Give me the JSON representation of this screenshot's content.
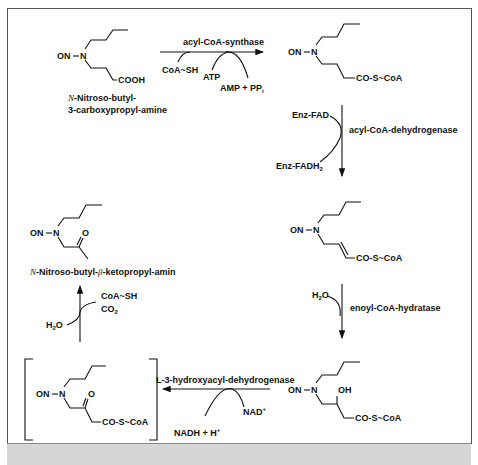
{
  "diagram": {
    "compounds": {
      "c1": {
        "group_left": "ON",
        "n": "N",
        "tail": "COOH",
        "name_line1_prefix": "N",
        "name_line1": "-Nitroso-butyl-",
        "name_line2": "3-carboxypropyl-amine"
      },
      "c2": {
        "group_left": "ON",
        "n": "N",
        "tail": "CO-S~CoA"
      },
      "c3": {
        "group_left": "ON",
        "n": "N",
        "tail": "CO-S~CoA"
      },
      "c4": {
        "group_left": "ON",
        "n": "N",
        "oh": "OH",
        "tail": "CO-S~CoA"
      },
      "c5": {
        "group_left": "ON",
        "n": "N",
        "o": "O",
        "tail": "CO-S~CoA"
      },
      "c6": {
        "group_left": "ON",
        "n": "N",
        "o": "O",
        "name_prefix": "N",
        "name": "-Nitroso-butyl-",
        "beta": "β",
        "name_rest": "-ketopropyl-amin"
      }
    },
    "steps": {
      "s1": {
        "enzyme": "acyl-CoA-synthase",
        "in1": "CoA~SH",
        "in2": "ATP",
        "out": "AMP  +  PP",
        "out_sub": "i"
      },
      "s2": {
        "enzyme": "acyl-CoA-dehydrogenase",
        "in": "Enz-FAD",
        "out": "Enz-FADH",
        "out_sub": "2"
      },
      "s3": {
        "enzyme": "enoyl-CoA-hydratase",
        "in": "H",
        "in_sub": "2",
        "in_end": "O"
      },
      "s4": {
        "enzyme": "L-3-hydroxyacyl-dehydrogenase",
        "in": "NAD",
        "in_sup": "+",
        "out": "NADH  +  H",
        "out_sup": "+"
      },
      "s5": {
        "in": "H",
        "in_sub": "2",
        "in_end": "O",
        "out1": "CoA~SH",
        "out2": "CO",
        "out2_sub": "2"
      }
    }
  }
}
